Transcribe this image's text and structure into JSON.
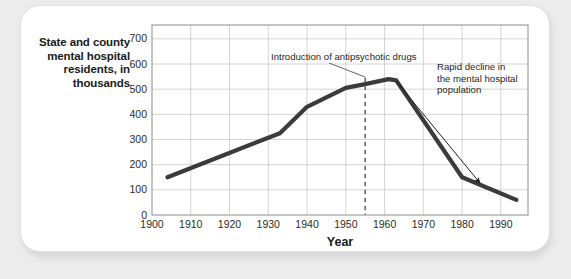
{
  "figure": {
    "y_axis_title": "State and county\nmental hospital\nresidents, in\nthousands",
    "y_axis_title_lines": [
      "State and county",
      "mental hospital",
      "residents, in",
      "thousands"
    ],
    "x_axis_title": "Year",
    "annotation_1": "Introduction of antipsychotic drugs",
    "annotation_2_lines": [
      "Rapid decline in",
      "the mental hospital",
      "population"
    ],
    "annotation_2": "Rapid decline in the mental hospital population",
    "line_color": "#3b3b3b",
    "grid_color": "#c9c9c9",
    "axis_color": "#8c8c8c",
    "card_color": "#ffffff",
    "page_color": "#ececec",
    "text_color": "#1a1a1a"
  },
  "chart_data": {
    "type": "line",
    "title": "",
    "xlabel": "Year",
    "ylabel": "State and county mental hospital residents, in thousands",
    "xlim": [
      1900,
      1997
    ],
    "ylim": [
      0,
      755
    ],
    "grid": true,
    "legend": "none",
    "xticks": [
      1900,
      1910,
      1920,
      1930,
      1940,
      1950,
      1960,
      1970,
      1980,
      1990
    ],
    "yticks": [
      0,
      100,
      200,
      300,
      400,
      500,
      600,
      700
    ],
    "x": [
      1904,
      1933,
      1940,
      1950,
      1955,
      1961,
      1963,
      1980,
      1994
    ],
    "y": [
      150,
      325,
      430,
      505,
      520,
      540,
      535,
      150,
      60
    ],
    "series": [
      {
        "name": "State and county mental hospital residents",
        "units": "thousands",
        "points": [
          {
            "year": 1904,
            "value": 150
          },
          {
            "year": 1933,
            "value": 325
          },
          {
            "year": 1940,
            "value": 430
          },
          {
            "year": 1950,
            "value": 505
          },
          {
            "year": 1955,
            "value": 520
          },
          {
            "year": 1961,
            "value": 540
          },
          {
            "year": 1963,
            "value": 535
          },
          {
            "year": 1980,
            "value": 150
          },
          {
            "year": 1994,
            "value": 60
          }
        ]
      }
    ],
    "annotations": [
      {
        "text": "Introduction of antipsychotic drugs",
        "marker": "dashed-vertical-line",
        "at_year": 1955
      },
      {
        "text": "Rapid decline in the mental hospital population",
        "marker": "arrow",
        "from_year": 1963,
        "to_year": 1988
      }
    ]
  }
}
